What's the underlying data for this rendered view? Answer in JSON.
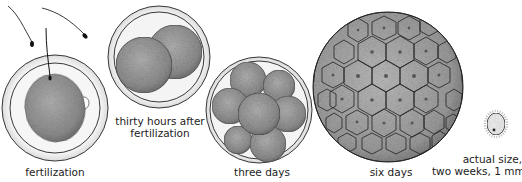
{
  "figure": {
    "stages": [
      {
        "id": "fertilization",
        "label_lines": [
          "fertilization"
        ]
      },
      {
        "id": "thirty-hours",
        "label_lines": [
          "thirty hours after",
          "fertilization"
        ]
      },
      {
        "id": "three-days",
        "label_lines": [
          "three days"
        ]
      },
      {
        "id": "six-days",
        "label_lines": [
          "six days"
        ]
      },
      {
        "id": "two-weeks",
        "label_lines": [
          "actual size,",
          "two weeks, 1 mm"
        ]
      }
    ]
  },
  "colors": {
    "cell_fill": "#9a9a9a",
    "cell_dark": "#6e6e6e",
    "outline": "#222222",
    "zona": "#e8e8e8",
    "background": "#ffffff"
  }
}
